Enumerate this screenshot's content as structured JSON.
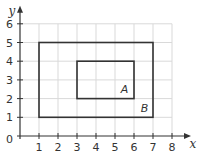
{
  "chart_data": {
    "type": "diagram-coordinate-plane",
    "title": "",
    "xlabel": "x",
    "ylabel": "y",
    "xlim": [
      0,
      8
    ],
    "ylim": [
      0,
      6
    ],
    "grid": true,
    "x_ticks": [
      1,
      2,
      3,
      4,
      5,
      6,
      7,
      8
    ],
    "y_ticks": [
      1,
      2,
      3,
      4,
      5,
      6
    ],
    "origin_label": "0",
    "shapes": [
      {
        "name": "A",
        "type": "rectangle",
        "x0": 3,
        "y0": 2,
        "x1": 6,
        "y1": 4,
        "label_pos": [
          5.5,
          2.5
        ]
      },
      {
        "name": "B",
        "type": "rectangle",
        "x0": 1,
        "y0": 1,
        "x1": 7,
        "y1": 5,
        "label_pos": [
          6.55,
          1.5
        ]
      }
    ]
  },
  "style": {
    "grid_color": "#d9d9d9",
    "axis_color": "#333333",
    "shape_color": "#333333"
  },
  "layout": {
    "origin_px": [
      20,
      136
    ],
    "unit_x_px": 19,
    "unit_y_px": 18.7
  }
}
